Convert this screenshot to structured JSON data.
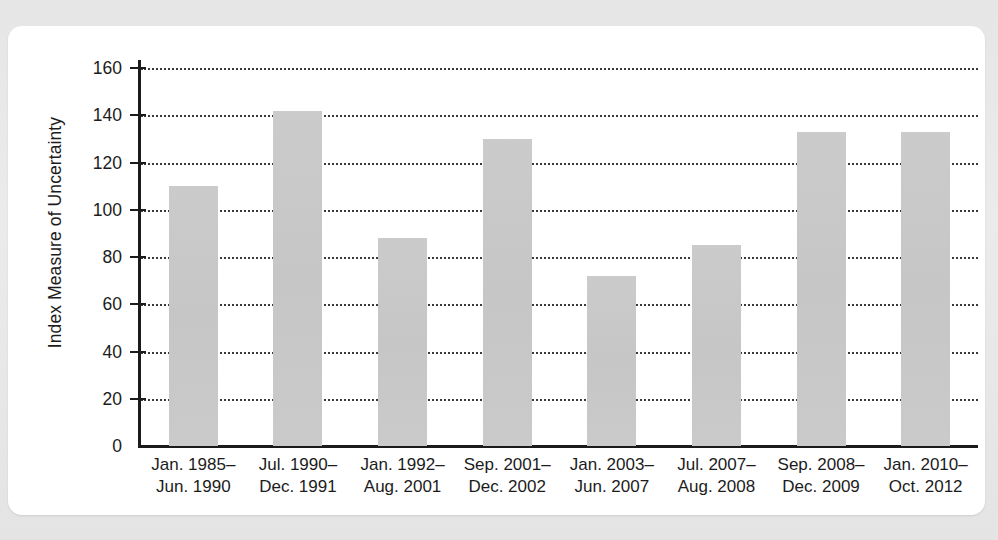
{
  "chart_data": {
    "type": "bar",
    "title": "",
    "xlabel": "",
    "ylabel": "Index Measure of Uncertainty",
    "ylim": [
      0,
      170
    ],
    "yticks": [
      0,
      20,
      40,
      60,
      80,
      100,
      120,
      140,
      160
    ],
    "grid": "horizontal-dotted",
    "legend": "none",
    "bar_color": "#c9c9c9",
    "axis_color": "#1b1b1b",
    "categories": [
      "Jan. 1985–Jun. 1990",
      "Jul. 1990–Dec. 1991",
      "Jan. 1992–Aug. 2001",
      "Sep. 2001–Dec. 2002",
      "Jan. 2003–Jun. 2007",
      "Jul. 2007–Aug. 2008",
      "Sep. 2008–Dec. 2009",
      "Jan. 2010–Oct. 2012"
    ],
    "category_lines": [
      [
        "Jan. 1985–",
        "Jun. 1990"
      ],
      [
        "Jul. 1990–",
        "Dec. 1991"
      ],
      [
        "Jan. 1992–",
        "Aug. 2001"
      ],
      [
        "Sep. 2001–",
        "Dec. 2002"
      ],
      [
        "Jan. 2003–",
        "Jun. 2007"
      ],
      [
        "Jul. 2007–",
        "Aug. 2008"
      ],
      [
        "Sep. 2008–",
        "Dec. 2009"
      ],
      [
        "Jan. 2010–",
        "Oct. 2012"
      ]
    ],
    "values": [
      110,
      142,
      88,
      130,
      72,
      85,
      133,
      133
    ]
  }
}
